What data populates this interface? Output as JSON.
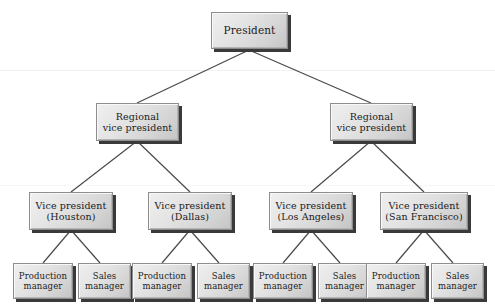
{
  "diagram": {
    "type": "organizational-chart",
    "background_color": "#ffffff",
    "box_fill_light": "#efefef",
    "box_fill_dark": "#c4c4c4",
    "box_border_color": "#8d8d8d",
    "box_shadow_color": "#3a3a3a",
    "connector_color": "#4a4a4a",
    "text_color": "#1b1b1b"
  },
  "nodes": {
    "president": {
      "line1": "President",
      "line2": ""
    },
    "regional_vp_left": {
      "line1": "Regional",
      "line2": "vice president"
    },
    "regional_vp_right": {
      "line1": "Regional",
      "line2": "vice president"
    },
    "vp_houston": {
      "line1": "Vice president",
      "line2": "(Houston)"
    },
    "vp_dallas": {
      "line1": "Vice president",
      "line2": "(Dallas)"
    },
    "vp_los_angeles": {
      "line1": "Vice president",
      "line2": "(Los Angeles)"
    },
    "vp_san_francisco": {
      "line1": "Vice president",
      "line2": "(San Francisco)"
    },
    "production_manager_houston": {
      "line1": "Production",
      "line2": "manager"
    },
    "sales_manager_houston": {
      "line1": "Sales",
      "line2": "manager"
    },
    "production_manager_dallas": {
      "line1": "Production",
      "line2": "manager"
    },
    "sales_manager_dallas": {
      "line1": "Sales",
      "line2": "manager"
    },
    "production_manager_los_angeles": {
      "line1": "Production",
      "line2": "manager"
    },
    "sales_manager_los_angeles": {
      "line1": "Sales",
      "line2": "manager"
    },
    "production_manager_san_francisco": {
      "line1": "Production",
      "line2": "manager"
    },
    "sales_manager_san_francisco": {
      "line1": "Sales",
      "line2": "manager"
    }
  },
  "hierarchy": {
    "root": "president",
    "edges": [
      [
        "president",
        "regional_vp_left"
      ],
      [
        "president",
        "regional_vp_right"
      ],
      [
        "regional_vp_left",
        "vp_houston"
      ],
      [
        "regional_vp_left",
        "vp_dallas"
      ],
      [
        "regional_vp_right",
        "vp_los_angeles"
      ],
      [
        "regional_vp_right",
        "vp_san_francisco"
      ],
      [
        "vp_houston",
        "production_manager_houston"
      ],
      [
        "vp_houston",
        "sales_manager_houston"
      ],
      [
        "vp_dallas",
        "production_manager_dallas"
      ],
      [
        "vp_dallas",
        "sales_manager_dallas"
      ],
      [
        "vp_los_angeles",
        "production_manager_los_angeles"
      ],
      [
        "vp_los_angeles",
        "sales_manager_los_angeles"
      ],
      [
        "vp_san_francisco",
        "production_manager_san_francisco"
      ],
      [
        "vp_san_francisco",
        "sales_manager_san_francisco"
      ]
    ]
  }
}
